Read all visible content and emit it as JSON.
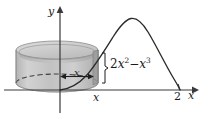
{
  "figure": {
    "background_color": "#ffffff",
    "axis_color": "#3a3a3a",
    "curve_color": "#2b2b2b",
    "shell_fill_color": "#c9c9c9",
    "shell_edge_color": "#8c8c8c",
    "shell_top_color": "#d8d8d8",
    "shell_band_color": "#b0b0b0"
  },
  "axes": {
    "y_label": "y",
    "x_label": "x",
    "x_ticks": [
      {
        "value": "2",
        "position_px": 178
      }
    ]
  },
  "annotations": {
    "radius_label": "x",
    "foot_label": "x",
    "height_label": {
      "coefficient": "2",
      "variable1": "x",
      "exponent1": "2",
      "operator": "−",
      "variable2": "x",
      "exponent2": "3",
      "full_text": "2x² − x³"
    }
  },
  "curve": {
    "equation": "2x^2 - x^3",
    "domain": [
      0,
      2
    ],
    "peak_x": 1.333,
    "description": "cubic curve rising from origin to a maximum then falling to zero at x = 2"
  },
  "shell": {
    "shape": "cylinder",
    "radius_label": "x",
    "height_label": "2x² − x³"
  }
}
